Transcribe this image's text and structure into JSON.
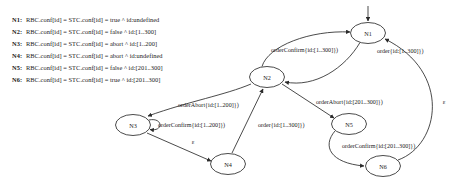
{
  "legend": {
    "rows": [
      {
        "key": "N1:",
        "text": "RBC.conf[id] = STC.conf[id] = true ^ id:undefined"
      },
      {
        "key": "N2:",
        "text": "RBC.conf[id] = STC.conf[id] = false ^ id:[1..300]"
      },
      {
        "key": "N3:",
        "text": "RBC.conf[id] = STC.conf[id] = abort ^ id:[1..200]"
      },
      {
        "key": "N4:",
        "text": "RBC.conf[id] = STC.conf[id] = abort ^ id:undefined"
      },
      {
        "key": "N5:",
        "text": "RBC.conf[id] = STC.conf[id] = false ^ id:[201..300]"
      },
      {
        "key": "N6:",
        "text": "RBC.conf[id] = STC.conf[id] = true ^ id:[201..300]"
      }
    ]
  },
  "graph": {
    "nodes": [
      {
        "id": "N1",
        "label": "N1",
        "cx": 368,
        "cy": 33,
        "rx": 17.5,
        "ry": 10.5
      },
      {
        "id": "N2",
        "label": "N2",
        "cx": 267,
        "cy": 77,
        "rx": 17.5,
        "ry": 10.5
      },
      {
        "id": "N3",
        "label": "N3",
        "cx": 133,
        "cy": 125,
        "rx": 17.5,
        "ry": 10.5
      },
      {
        "id": "N4",
        "label": "N4",
        "cx": 228,
        "cy": 164,
        "rx": 17.5,
        "ry": 10.5
      },
      {
        "id": "N5",
        "label": "N5",
        "cx": 349,
        "cy": 124,
        "rx": 17.5,
        "ry": 10.5
      },
      {
        "id": "N6",
        "label": "N6",
        "cx": 383,
        "cy": 166,
        "rx": 17.5,
        "ry": 10.5
      }
    ],
    "start_marker": {
      "target": "N1"
    },
    "edges": [
      {
        "id": "e-start",
        "from": "",
        "to": "N1",
        "label": ""
      },
      {
        "id": "e-n1-n2",
        "from": "N1",
        "to": "N2",
        "label": "order{id:[1..300]})"
      },
      {
        "id": "e-n2-n1",
        "from": "N2",
        "to": "N1",
        "label": "orderConfirm{id:[1..300]})"
      },
      {
        "id": "e-n2-n3",
        "from": "N2",
        "to": "N3",
        "label": "orderAbort{id:[1..200]})"
      },
      {
        "id": "e-n3-n3",
        "from": "N3",
        "to": "N3",
        "label": "orderConfirm{id:[1..200]})"
      },
      {
        "id": "e-n3-n4",
        "from": "N3",
        "to": "N4",
        "label": "ε"
      },
      {
        "id": "e-n4-n2",
        "from": "N4",
        "to": "N2",
        "label": "order{id:[1..300]})"
      },
      {
        "id": "e-n2-n5",
        "from": "N2",
        "to": "N5",
        "label": "orderAbort{id:[201..300]})"
      },
      {
        "id": "e-n5-n6",
        "from": "N5",
        "to": "N6",
        "label": "orderConfirm{id:[201..300]})"
      },
      {
        "id": "e-n6-n1",
        "from": "N6",
        "to": "N1",
        "label": "ε"
      }
    ],
    "labels": [
      {
        "id": "lbl-order-n1n2",
        "text": "order{id:[1..300]})",
        "x": 377,
        "y": 53,
        "anchor": "start"
      },
      {
        "id": "lbl-orderconfirm-n2n1",
        "text": "orderConfirm{id:[1..300]})",
        "x": 271,
        "y": 52,
        "anchor": "start"
      },
      {
        "id": "lbl-orderabort-n2n3",
        "text": "orderAbort{id:[1..200]})",
        "x": 178,
        "y": 107,
        "anchor": "start"
      },
      {
        "id": "lbl-orderconfirm-n3n3",
        "text": "orderConfirm{id:[1..200]})",
        "x": 158,
        "y": 127,
        "anchor": "start"
      },
      {
        "id": "lbl-order-n4n2",
        "text": "order{id:[1..300]})",
        "x": 258,
        "y": 127,
        "anchor": "start"
      },
      {
        "id": "lbl-orderabort-n2n5",
        "text": "orderAbort{id:[201..300]})",
        "x": 316,
        "y": 104,
        "anchor": "start"
      },
      {
        "id": "lbl-orderconfirm-n5n6",
        "text": "orderConfirm{id:[201..300]})",
        "x": 342,
        "y": 148,
        "anchor": "start"
      },
      {
        "id": "lbl-eps-n3n4",
        "text": "ε",
        "x": 193,
        "y": 144,
        "anchor": "middle"
      },
      {
        "id": "lbl-eps-n6n1",
        "text": "ε",
        "x": 444,
        "y": 104,
        "anchor": "middle"
      }
    ]
  },
  "colors": {
    "stroke": "#2b2b2b",
    "text": "#1a1a1a",
    "background": "#ffffff"
  }
}
